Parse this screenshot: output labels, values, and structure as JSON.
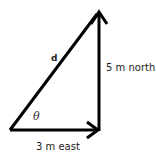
{
  "diagram": {
    "type": "vector-addition-triangle",
    "vectors": {
      "east": {
        "label": "3 m east",
        "magnitude": 3,
        "unit": "m",
        "direction": "east"
      },
      "north": {
        "label": "5 m north",
        "magnitude": 5,
        "unit": "m",
        "direction": "north"
      },
      "resultant": {
        "label": "d"
      }
    },
    "angle": {
      "symbol": "θ"
    },
    "colors": {
      "stroke": "#000000",
      "text": "#222222",
      "background": "#ffffff"
    }
  }
}
